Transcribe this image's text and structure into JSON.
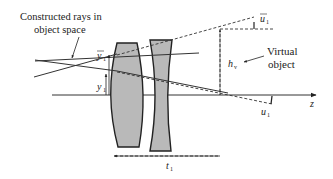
{
  "diagram": {
    "type": "optical-ray-diagram",
    "labels": {
      "constructed_rays_line1": "Constructed rays in",
      "constructed_rays_line2": "object space",
      "virtual_object_line1": "Virtual",
      "virtual_object_line2": "object",
      "y_bar_1": "y",
      "y_bar_1_sub": "1",
      "y_1": "y",
      "y_1_sub": "1",
      "u_bar_1": "u",
      "u_bar_1_sub": "1",
      "h_v": "h",
      "h_v_sub": "v",
      "u_1": "u",
      "u_1_sub": "1",
      "z_axis": "z",
      "t_1": "t",
      "t_1_sub": "1"
    },
    "elements": [
      {
        "name": "lens-1",
        "kind": "biconvex lens"
      },
      {
        "name": "lens-2",
        "kind": "biconcave lens"
      }
    ],
    "colors": {
      "lens_fill": "#b9b9b9",
      "line": "#333333",
      "background": "#ffffff"
    }
  }
}
